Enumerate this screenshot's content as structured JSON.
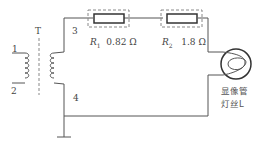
{
  "diagram": {
    "transformer": {
      "label": "T",
      "terminals": [
        "1",
        "2",
        "3",
        "4"
      ]
    },
    "resistors": [
      {
        "name": "R",
        "sub": "1",
        "value": "0.82 Ω"
      },
      {
        "name": "R",
        "sub": "2",
        "value": "1.8 Ω"
      }
    ],
    "load": {
      "line1": "显像管",
      "line2": "灯丝L"
    },
    "colors": {
      "wire": "#555555",
      "dashed": "#888888"
    }
  }
}
